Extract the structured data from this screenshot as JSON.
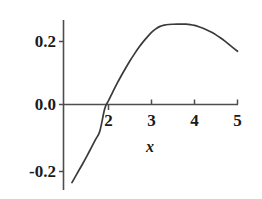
{
  "chart_data": {
    "type": "line",
    "title": "",
    "subtitle": "",
    "xlabel": "x",
    "ylabel": "",
    "xlim": [
      1.1,
      5.0
    ],
    "ylim": [
      -0.26,
      0.28
    ],
    "xticks": [
      2,
      3,
      4,
      5
    ],
    "xtick_labels": [
      "2",
      "3",
      "4",
      "5"
    ],
    "yticks": [
      -0.2,
      0.0,
      0.2
    ],
    "ytick_labels": [
      "-0.2",
      "0.0",
      "0.2"
    ],
    "grid": false,
    "legend": null,
    "axis_color": "#4d4d4d",
    "curve_color": "#3a3a3a",
    "zero_crossing_x": 1.95,
    "peak": {
      "x": 3.8,
      "y": 0.255
    },
    "series": [
      {
        "name": "curve",
        "x": [
          1.15,
          1.2,
          1.3,
          1.4,
          1.5,
          1.6,
          1.7,
          1.8,
          1.9,
          1.95,
          2.0,
          2.1,
          2.2,
          2.3,
          2.4,
          2.5,
          2.6,
          2.7,
          2.8,
          2.9,
          3.0,
          3.1,
          3.2,
          3.3,
          3.4,
          3.5,
          3.6,
          3.7,
          3.8,
          3.9,
          4.0,
          4.1,
          4.2,
          4.3,
          4.4,
          4.5,
          4.6,
          4.7,
          4.8,
          4.9,
          5.0
        ],
        "y": [
          -0.248,
          -0.236,
          -0.212,
          -0.188,
          -0.163,
          -0.137,
          -0.111,
          -0.084,
          -0.02,
          0.0,
          0.012,
          0.04,
          0.067,
          0.092,
          0.116,
          0.139,
          0.16,
          0.18,
          0.198,
          0.214,
          0.229,
          0.24,
          0.248,
          0.252,
          0.254,
          0.2548,
          0.2552,
          0.2553,
          0.2549,
          0.2535,
          0.251,
          0.247,
          0.242,
          0.236,
          0.229,
          0.221,
          0.212,
          0.202,
          0.191,
          0.18,
          0.169
        ]
      }
    ]
  },
  "axes": {
    "x_axis_name": "horizontal-axis",
    "y_axis_name": "vertical-axis",
    "x_title": "x"
  }
}
